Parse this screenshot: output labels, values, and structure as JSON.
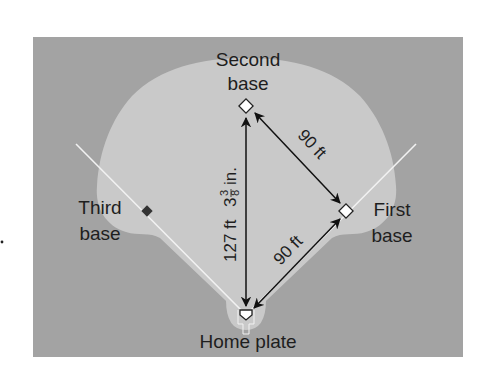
{
  "diagram": {
    "type": "baseball-infield",
    "colors": {
      "background": "#ffffff",
      "outfield": "#a3a3a3",
      "infield": "#c9c9c9",
      "foul_line": "#f2f2f2",
      "arrow": "#111111",
      "text": "#1e1e1e",
      "base_fill": "#ffffff",
      "third_base_marker": "#333333"
    },
    "labels": {
      "second_base": [
        "Second",
        "base"
      ],
      "first_base": [
        "First",
        "base"
      ],
      "third_base": [
        "Third",
        "base"
      ],
      "home_plate": "Home plate"
    },
    "measurements": {
      "second_to_first": "90 ft",
      "home_to_first": "90 ft",
      "home_to_second_whole": "127 ft",
      "home_to_second_int": "3",
      "home_to_second_frac_num": "3",
      "home_to_second_frac_den": "8",
      "home_to_second_unit": "in."
    }
  }
}
